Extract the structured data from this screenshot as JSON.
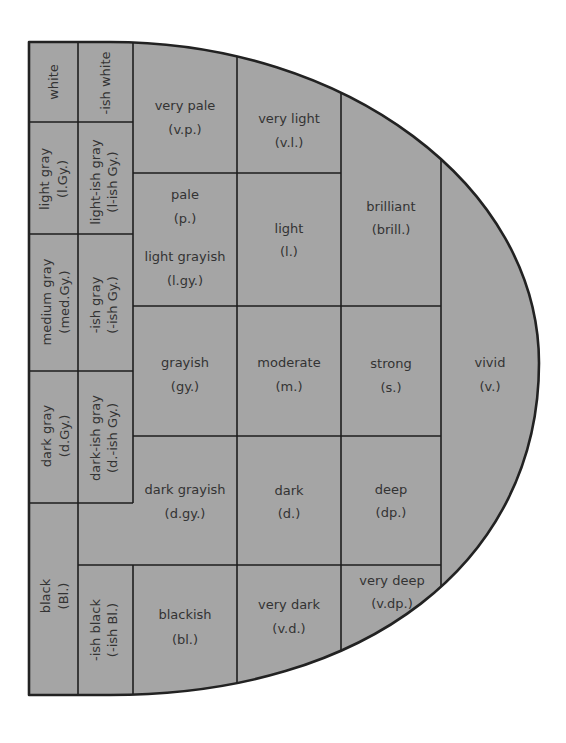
{
  "colors": {
    "cell_fill": "#a5a5a5",
    "grid_line": "#1e1e1e",
    "label_text": "#333333",
    "background": "#ffffff"
  },
  "neutral": [
    {
      "name": "white"
    },
    {
      "name": "light gray",
      "abbr": "(l.Gy.)"
    },
    {
      "name": "medium gray",
      "abbr": "(med.Gy.)"
    },
    {
      "name": "dark gray",
      "abbr": "(d.Gy.)"
    },
    {
      "name": "black",
      "abbr": "(Bl.)"
    }
  ],
  "ish_neutral": [
    {
      "name": "-ish white"
    },
    {
      "name": "light-ish gray",
      "abbr": "(l-ish Gy.)"
    },
    {
      "name": "-ish gray",
      "abbr": "(-ish Gy.)"
    },
    {
      "name": "dark-ish gray",
      "abbr": "(d.-ish Gy.)"
    },
    {
      "name": "-ish black",
      "abbr": "(-ish Bl.)"
    }
  ],
  "tones": {
    "very_pale": {
      "name": "very pale",
      "abbr": "(v.p.)"
    },
    "very_light": {
      "name": "very light",
      "abbr": "(v.l.)"
    },
    "pale": {
      "name": "pale",
      "abbr": "(p.)"
    },
    "light_grayish": {
      "name": "light grayish",
      "abbr": "(l.gy.)"
    },
    "light": {
      "name": "light",
      "abbr": "(l.)"
    },
    "brilliant": {
      "name": "brilliant",
      "abbr": "(brill.)"
    },
    "grayish": {
      "name": "grayish",
      "abbr": "(gy.)"
    },
    "moderate": {
      "name": "moderate",
      "abbr": "(m.)"
    },
    "strong": {
      "name": "strong",
      "abbr": "(s.)"
    },
    "vivid": {
      "name": "vivid",
      "abbr": "(v.)"
    },
    "dark_grayish": {
      "name": "dark grayish",
      "abbr": "(d.gy.)"
    },
    "dark": {
      "name": "dark",
      "abbr": "(d.)"
    },
    "deep": {
      "name": "deep",
      "abbr": "(dp.)"
    },
    "very_deep": {
      "name": "very deep",
      "abbr": "(v.dp.)"
    },
    "blackish": {
      "name": "blackish",
      "abbr": "(bl.)"
    },
    "very_dark": {
      "name": "very dark",
      "abbr": "(v.d.)"
    }
  }
}
